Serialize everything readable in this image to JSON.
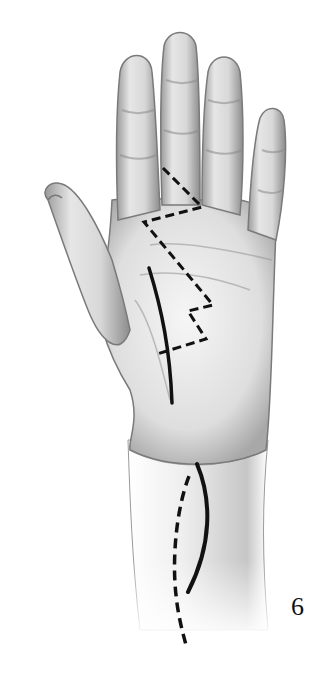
{
  "figure": {
    "label": "6",
    "incisions": [
      {
        "name": "zigzag-palm-finger",
        "style": "dashed"
      },
      {
        "name": "thenar-crease",
        "style": "solid"
      },
      {
        "name": "transverse-crossing",
        "style": "dashed"
      },
      {
        "name": "wrist-curved",
        "style": "solid"
      },
      {
        "name": "forearm-extension",
        "style": "dashed"
      }
    ],
    "colors": {
      "skin_light": "#f2f2f2",
      "skin_mid": "#cfcfcf",
      "skin_shadow": "#8a8a8a",
      "incision": "#111111"
    }
  }
}
